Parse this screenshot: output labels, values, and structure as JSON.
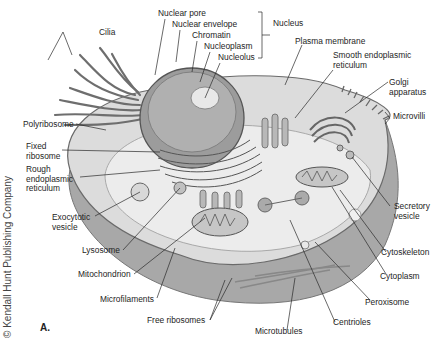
{
  "figure": {
    "panel_label": "A.",
    "copyright": "© Kendall Hunt Publishing Company"
  },
  "labels": [
    {
      "id": "cilia",
      "text": "Cilia"
    },
    {
      "id": "nuclear-pore",
      "text": "Nuclear pore"
    },
    {
      "id": "nuclear-envelope",
      "text": "Nuclear envelope"
    },
    {
      "id": "chromatin",
      "text": "Chromatin"
    },
    {
      "id": "nucleoplasm",
      "text": "Nucleoplasm"
    },
    {
      "id": "nucleolus",
      "text": "Nucleolus"
    },
    {
      "id": "nucleus",
      "text": "Nucleus"
    },
    {
      "id": "plasma-membrane",
      "text": "Plasma membrane"
    },
    {
      "id": "smooth-er",
      "text": "Smooth endoplasmic\nreticulum"
    },
    {
      "id": "golgi",
      "text": "Golgi\napparatus"
    },
    {
      "id": "microvilli",
      "text": "Microvilli"
    },
    {
      "id": "polyribosome",
      "text": "Polyribosome"
    },
    {
      "id": "fixed-ribosome",
      "text": "Fixed\nribosome"
    },
    {
      "id": "rough-er",
      "text": "Rough\nendoplasmic\nreticulum"
    },
    {
      "id": "exocytotic-vesicle",
      "text": "Exocytotic\nvesicle"
    },
    {
      "id": "lysosome",
      "text": "Lysosome"
    },
    {
      "id": "mitochondrion",
      "text": "Mitochondrion"
    },
    {
      "id": "microfilaments",
      "text": "Microfilaments"
    },
    {
      "id": "free-ribosomes",
      "text": "Free ribosomes"
    },
    {
      "id": "microtubules",
      "text": "Microtubules"
    },
    {
      "id": "centrioles",
      "text": "Centrioles"
    },
    {
      "id": "peroxisome",
      "text": "Peroxisome"
    },
    {
      "id": "cytoplasm",
      "text": "Cytoplasm"
    },
    {
      "id": "cytoskeleton",
      "text": "Cytoskeleton"
    },
    {
      "id": "secretory-vesicle",
      "text": "Secretory\nvesicle"
    }
  ],
  "colors": {
    "cell_outer": "#a9a9a9",
    "cytoplasm": "#e4e4e4",
    "nucleus": "#9a9a9a",
    "line": "#2a2a2a"
  }
}
